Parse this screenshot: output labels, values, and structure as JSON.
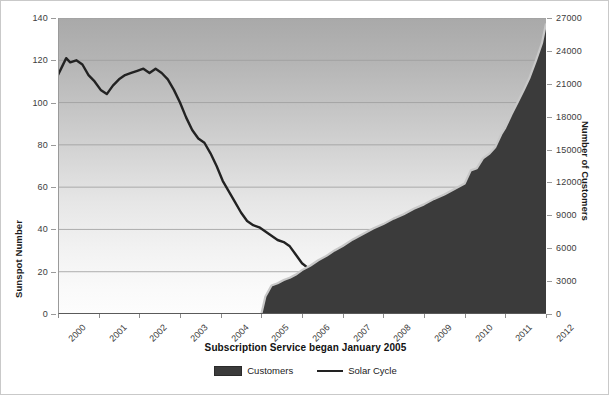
{
  "chart": {
    "caption": "Subscription Service began January 2005",
    "y_left_title": "Sunspot Number",
    "y_right_title": "Number of Customers",
    "legend": [
      {
        "key": "customers",
        "label": "Customers",
        "marker": "area-swatch",
        "color": "#3b3b3b"
      },
      {
        "key": "solar",
        "label": "Solar Cycle",
        "marker": "line-swatch",
        "color": "#222222"
      }
    ]
  },
  "chart_data": {
    "type": "area",
    "title": "Subscription Service began January 2005",
    "xlabel": "",
    "ylabel": "Sunspot Number",
    "y2label": "Number of Customers",
    "grid": true,
    "legend_position": "bottom",
    "xlim": [
      2000,
      2012
    ],
    "ylim": [
      0,
      140
    ],
    "y2lim": [
      0,
      27000
    ],
    "x_tick_labels": [
      "2000",
      "2001",
      "2002",
      "2003",
      "2004",
      "2005",
      "2006",
      "2007",
      "2008",
      "2009",
      "2010",
      "2011",
      "2012"
    ],
    "y_tick_labels": [
      "0",
      "20",
      "40",
      "60",
      "80",
      "100",
      "120",
      "140"
    ],
    "y2_tick_labels": [
      "0",
      "3000",
      "6000",
      "9000",
      "12000",
      "15000",
      "18000",
      "21000",
      "24000",
      "27000"
    ],
    "series": [
      {
        "name": "Solar Cycle",
        "axis": "left",
        "type": "line",
        "color": "#222222",
        "x": [
          2000.0,
          2000.1,
          2000.2,
          2000.3,
          2000.45,
          2000.6,
          2000.75,
          2000.9,
          2001.05,
          2001.2,
          2001.35,
          2001.5,
          2001.65,
          2001.8,
          2001.95,
          2002.1,
          2002.25,
          2002.4,
          2002.55,
          2002.7,
          2002.85,
          2003.0,
          2003.15,
          2003.3,
          2003.45,
          2003.6,
          2003.75,
          2003.9,
          2004.05,
          2004.2,
          2004.35,
          2004.5,
          2004.65,
          2004.8,
          2004.95,
          2005.1,
          2005.25,
          2005.4,
          2005.55,
          2005.7,
          2005.85,
          2006.0,
          2006.2,
          2006.4,
          2006.6,
          2006.8,
          2007.0,
          2007.25,
          2007.5,
          2007.75,
          2008.0,
          2008.25,
          2008.5,
          2008.75,
          2009.0,
          2009.25,
          2009.5,
          2009.75,
          2010.0,
          2010.25,
          2010.5,
          2010.75,
          2011.0,
          2011.15,
          2011.3,
          2011.45,
          2011.6,
          2011.75,
          2011.9,
          2012.0
        ],
        "y": [
          113,
          117,
          121,
          119,
          120,
          118,
          113,
          110,
          106,
          104,
          108,
          111,
          113,
          114,
          115,
          116,
          114,
          116,
          114,
          111,
          106,
          100,
          93,
          87,
          83,
          81,
          76,
          70,
          63,
          58,
          53,
          48,
          44,
          42,
          41,
          39,
          37,
          35,
          34,
          32,
          28,
          24,
          21,
          18,
          16,
          14,
          12,
          10,
          8,
          6,
          5,
          4,
          2,
          1,
          1,
          1,
          2,
          3,
          6,
          10,
          14,
          19,
          27,
          34,
          42,
          48,
          52,
          56,
          60,
          66
        ],
        "units": "sunspot number"
      },
      {
        "name": "Customers",
        "axis": "right",
        "type": "area",
        "color": "#3b3b3b",
        "edge_color": "#c8c8c8",
        "x": [
          2005.0,
          2005.1,
          2005.25,
          2005.4,
          2005.55,
          2005.7,
          2005.85,
          2006.0,
          2006.2,
          2006.4,
          2006.6,
          2006.8,
          2007.0,
          2007.25,
          2007.5,
          2007.75,
          2008.0,
          2008.25,
          2008.5,
          2008.75,
          2009.0,
          2009.25,
          2009.5,
          2009.75,
          2010.0,
          2010.15,
          2010.3,
          2010.45,
          2010.6,
          2010.75,
          2010.9,
          2011.0,
          2011.15,
          2011.3,
          2011.45,
          2011.6,
          2011.75,
          2011.9,
          2012.0
        ],
        "y": [
          0,
          1600,
          2600,
          2800,
          3100,
          3300,
          3600,
          4000,
          4400,
          4900,
          5300,
          5800,
          6200,
          6800,
          7300,
          7800,
          8200,
          8700,
          9100,
          9600,
          10000,
          10500,
          10900,
          11400,
          11900,
          13100,
          13300,
          14200,
          14600,
          15200,
          16400,
          17000,
          18200,
          19300,
          20400,
          21600,
          23100,
          24700,
          26500
        ],
        "units": "customers"
      }
    ]
  }
}
